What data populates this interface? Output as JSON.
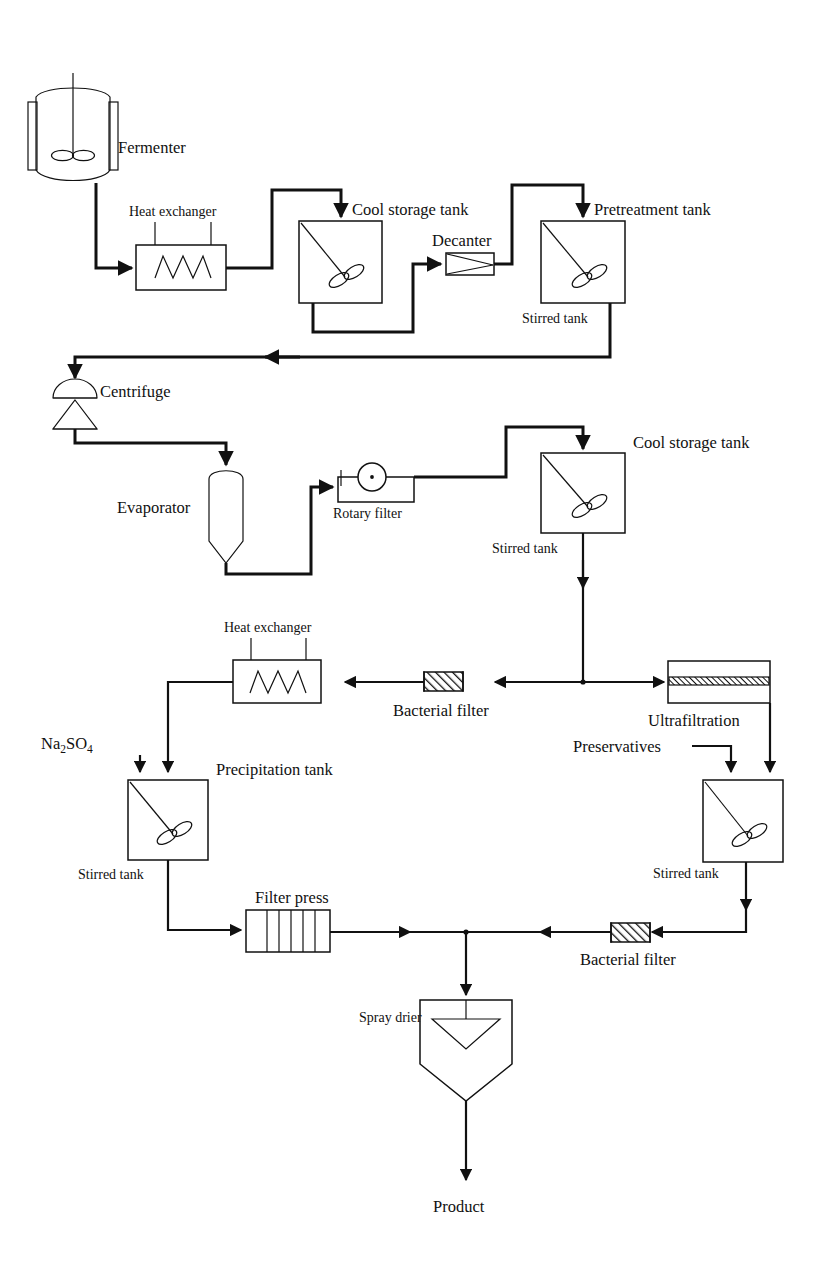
{
  "diagram": {
    "type": "process-flow-diagram",
    "background_color": "#ffffff",
    "line_color": "#111111"
  },
  "labels": {
    "fermenter": "Fermenter",
    "heat_exchanger_top": "Heat exchanger",
    "cool_storage_tank_top": "Cool storage tank",
    "decanter": "Decanter",
    "pretreatment_tank": "Pretreatment tank",
    "stirred_tank_1": "Stirred tank",
    "centrifuge": "Centrifuge",
    "evaporator": "Evaporator",
    "rotary_filter": "Rotary filter",
    "cool_storage_tank_mid": "Cool storage tank",
    "stirred_tank_2": "Stirred tank",
    "heat_exchanger_bottom": "Heat exchanger",
    "bacterial_filter_upper": "Bacterial filter",
    "ultrafiltration": "Ultrafiltration",
    "preservatives": "Preservatives",
    "sodium_sulfate_main": "Na",
    "sodium_sulfate_sub1": "2",
    "sodium_sulfate_mid": "SO",
    "sodium_sulfate_sub2": "4",
    "precipitation_tank": "Precipitation tank",
    "stirred_tank_3": "Stirred tank",
    "stirred_tank_4": "Stirred tank",
    "filter_press": "Filter press",
    "bacterial_filter_lower": "Bacterial filter",
    "spray_drier": "Spray drier",
    "product": "Product"
  },
  "equipment": [
    {
      "id": "fermenter",
      "name": "Fermenter",
      "shape": "jacketed-stirred-vessel"
    },
    {
      "id": "heat-exchanger-top",
      "name": "Heat exchanger",
      "shape": "rectangle-with-zigzag-coil"
    },
    {
      "id": "cool-storage-tank-top",
      "name": "Cool storage tank",
      "shape": "square-stirred-tank"
    },
    {
      "id": "decanter",
      "name": "Decanter",
      "shape": "rectangle-with-wedge"
    },
    {
      "id": "pretreatment-tank",
      "name": "Pretreatment tank",
      "shape": "square-stirred-tank"
    },
    {
      "id": "centrifuge",
      "name": "Centrifuge",
      "shape": "dome-and-cone"
    },
    {
      "id": "evaporator",
      "name": "Evaporator",
      "shape": "vertical-column"
    },
    {
      "id": "rotary-filter",
      "name": "Rotary filter",
      "shape": "drum-in-trough"
    },
    {
      "id": "cool-storage-tank-mid",
      "name": "Cool storage tank",
      "shape": "square-stirred-tank"
    },
    {
      "id": "heat-exchanger-bottom",
      "name": "Heat exchanger",
      "shape": "rectangle-with-zigzag-coil"
    },
    {
      "id": "bacterial-filter-upper",
      "name": "Bacterial filter",
      "shape": "hatched-cartridge"
    },
    {
      "id": "ultrafiltration",
      "name": "Ultrafiltration",
      "shape": "membrane-module"
    },
    {
      "id": "precipitation-tank",
      "name": "Precipitation tank",
      "shape": "square-stirred-tank"
    },
    {
      "id": "mixing-tank-right",
      "name": "Stirred tank",
      "shape": "square-stirred-tank"
    },
    {
      "id": "filter-press",
      "name": "Filter press",
      "shape": "plate-and-frame"
    },
    {
      "id": "bacterial-filter-lower",
      "name": "Bacterial filter",
      "shape": "hatched-cartridge"
    },
    {
      "id": "spray-drier",
      "name": "Spray drier",
      "shape": "pentagon-with-atomizer"
    }
  ],
  "streams": [
    {
      "from": "fermenter",
      "to": "heat-exchanger-top"
    },
    {
      "from": "heat-exchanger-top",
      "to": "cool-storage-tank-top"
    },
    {
      "from": "cool-storage-tank-top",
      "to": "decanter"
    },
    {
      "from": "decanter",
      "to": "pretreatment-tank"
    },
    {
      "from": "pretreatment-tank",
      "to": "centrifuge"
    },
    {
      "from": "centrifuge",
      "to": "evaporator"
    },
    {
      "from": "evaporator",
      "to": "rotary-filter"
    },
    {
      "from": "rotary-filter",
      "to": "cool-storage-tank-mid"
    },
    {
      "from": "cool-storage-tank-mid",
      "to": "bacterial-filter-upper"
    },
    {
      "from": "cool-storage-tank-mid",
      "to": "ultrafiltration"
    },
    {
      "from": "bacterial-filter-upper",
      "to": "heat-exchanger-bottom"
    },
    {
      "from": "heat-exchanger-bottom",
      "to": "precipitation-tank"
    },
    {
      "from": "sodium-sulfate-feed",
      "to": "precipitation-tank"
    },
    {
      "from": "ultrafiltration",
      "to": "mixing-tank-right"
    },
    {
      "from": "preservatives-feed",
      "to": "mixing-tank-right"
    },
    {
      "from": "precipitation-tank",
      "to": "filter-press"
    },
    {
      "from": "mixing-tank-right",
      "to": "bacterial-filter-lower"
    },
    {
      "from": "filter-press",
      "to": "spray-drier"
    },
    {
      "from": "bacterial-filter-lower",
      "to": "spray-drier"
    },
    {
      "from": "spray-drier",
      "to": "product"
    }
  ]
}
